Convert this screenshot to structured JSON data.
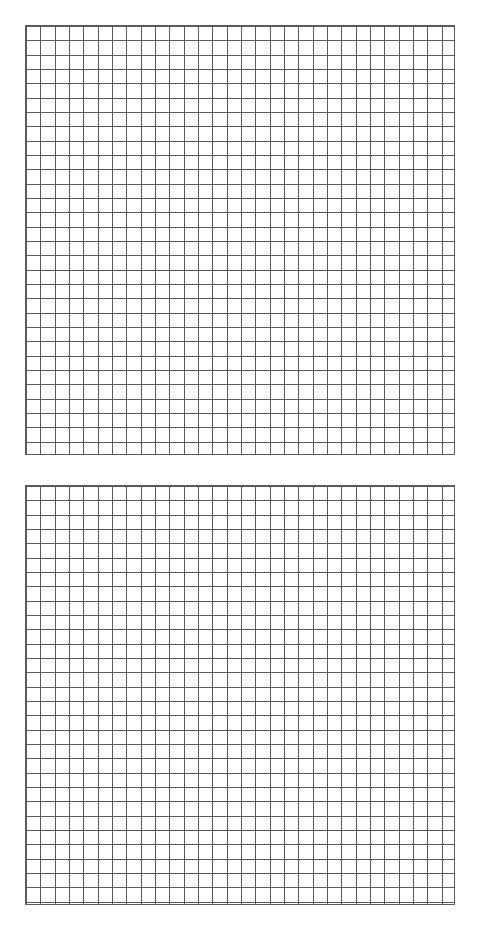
{
  "document": {
    "title": "Blank Graph Paper Worksheet",
    "background_color": "#ffffff",
    "page_width": 485,
    "page_height": 933
  },
  "grids": [
    {
      "name": "upper-grid",
      "label": "Upper blank coordinate grid",
      "columns": 30,
      "rows": 30,
      "cell_size_px": 14.33,
      "x": 25,
      "y": 25,
      "width": 430,
      "height": 430,
      "line_color": "#5a5a5a",
      "border_color": "#5a5a5a",
      "fill_color": "#ffffff",
      "line_width_px": 1,
      "labels": [],
      "axis_labels": [],
      "tick_labels": [],
      "content": ""
    },
    {
      "name": "lower-grid",
      "label": "Lower blank coordinate grid",
      "columns": 30,
      "rows": 29,
      "cell_size_px": 14.33,
      "x": 25,
      "y": 485,
      "width": 430,
      "height": 420,
      "line_color": "#5a5a5a",
      "border_color": "#5a5a5a",
      "fill_color": "#ffffff",
      "line_width_px": 1,
      "labels": [],
      "axis_labels": [],
      "tick_labels": [],
      "content": ""
    }
  ],
  "chart_data": {
    "type": "table",
    "title": "",
    "xlabel": "",
    "ylabel": "",
    "categories": [],
    "values": []
  }
}
